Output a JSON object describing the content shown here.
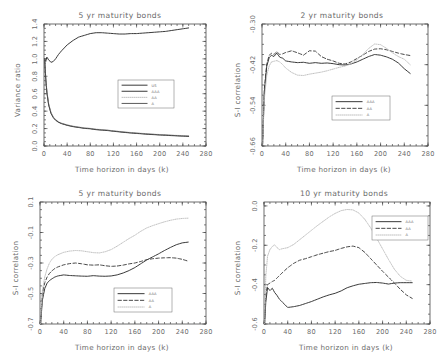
{
  "figure": {
    "panels": [
      {
        "id": "panel-5yr-variance-ratio",
        "title": "5 yr maturity bonds",
        "xlabel": "Time horizon in days (k)",
        "ylabel": "Variance ratio",
        "legend": [
          "US",
          "AAA",
          "AA",
          "A"
        ]
      },
      {
        "id": "panel-2yr-correlation",
        "title": "2 yr maturity bonds",
        "xlabel": "Time horizon in days (k)",
        "ylabel": "S-I correlation",
        "legend": [
          "AAA",
          "AA",
          "A"
        ]
      },
      {
        "id": "panel-5yr-correlation",
        "title": "5 yr maturity bonds",
        "xlabel": "Time horizon in days (k)",
        "ylabel": "S-I correlation",
        "legend": [
          "AAA",
          "AA",
          "A"
        ]
      },
      {
        "id": "panel-10yr-correlation",
        "title": "10 yr maturity bonds",
        "xlabel": "Time horizon in days (k)",
        "ylabel": "S-I correlation",
        "legend": [
          "AAA",
          "AA",
          "A"
        ]
      }
    ]
  },
  "chart_data": [
    {
      "type": "line",
      "title": "5 yr maturity bonds",
      "xlabel": "Time horizon in days (k)",
      "ylabel": "Variance ratio",
      "xlim": [
        0,
        280
      ],
      "ylim": [
        0.0,
        1.4
      ],
      "xticks": [
        0,
        40,
        80,
        120,
        160,
        200,
        240,
        280
      ],
      "yticks": [
        0.0,
        0.2,
        0.4,
        0.6,
        0.8,
        1.0,
        1.2,
        1.4
      ],
      "grid": false,
      "legend_position": "center-right",
      "x": [
        1,
        3,
        5,
        8,
        12,
        16,
        20,
        25,
        30,
        40,
        50,
        60,
        70,
        80,
        90,
        100,
        110,
        120,
        130,
        140,
        150,
        160,
        170,
        180,
        190,
        200,
        210,
        220,
        230,
        240,
        250
      ],
      "series": [
        {
          "name": "US",
          "style": "solid",
          "values": [
            1.0,
            0.97,
            1.02,
            0.99,
            0.96,
            0.97,
            1.0,
            1.05,
            1.09,
            1.16,
            1.21,
            1.25,
            1.27,
            1.29,
            1.3,
            1.3,
            1.295,
            1.29,
            1.285,
            1.285,
            1.29,
            1.29,
            1.295,
            1.3,
            1.305,
            1.31,
            1.315,
            1.325,
            1.335,
            1.345,
            1.355
          ]
        },
        {
          "name": "AAA",
          "style": "solid",
          "values": [
            1.0,
            0.78,
            0.62,
            0.48,
            0.38,
            0.33,
            0.3,
            0.275,
            0.26,
            0.24,
            0.225,
            0.215,
            0.205,
            0.2,
            0.19,
            0.185,
            0.18,
            0.172,
            0.165,
            0.158,
            0.152,
            0.147,
            0.142,
            0.137,
            0.133,
            0.129,
            0.126,
            0.122,
            0.119,
            0.116,
            0.113
          ]
        },
        {
          "name": "AA",
          "style": "dotted",
          "values": [
            1.0,
            0.79,
            0.63,
            0.49,
            0.39,
            0.335,
            0.305,
            0.28,
            0.263,
            0.243,
            0.229,
            0.218,
            0.209,
            0.203,
            0.194,
            0.188,
            0.183,
            0.175,
            0.168,
            0.161,
            0.155,
            0.15,
            0.145,
            0.14,
            0.136,
            0.132,
            0.129,
            0.125,
            0.122,
            0.119,
            0.116
          ]
        },
        {
          "name": "A",
          "style": "dashdot",
          "values": [
            1.0,
            0.77,
            0.61,
            0.47,
            0.375,
            0.325,
            0.295,
            0.272,
            0.257,
            0.237,
            0.222,
            0.212,
            0.202,
            0.197,
            0.187,
            0.182,
            0.177,
            0.169,
            0.162,
            0.155,
            0.149,
            0.144,
            0.139,
            0.134,
            0.13,
            0.126,
            0.123,
            0.119,
            0.116,
            0.113,
            0.11
          ]
        }
      ]
    },
    {
      "type": "line",
      "title": "2 yr maturity bonds",
      "xlabel": "Time horizon in days (k)",
      "ylabel": "S-I correlation",
      "xlim": [
        0,
        280
      ],
      "ylim": [
        -0.66,
        -0.3
      ],
      "xticks": [
        0,
        40,
        80,
        120,
        160,
        200,
        240,
        280
      ],
      "yticks": [
        -0.66,
        -0.54,
        -0.42,
        -0.3
      ],
      "grid": false,
      "legend_position": "lower-right",
      "x": [
        1,
        4,
        8,
        12,
        16,
        20,
        25,
        30,
        35,
        40,
        50,
        60,
        70,
        80,
        90,
        100,
        110,
        120,
        130,
        140,
        150,
        160,
        170,
        180,
        190,
        200,
        210,
        220,
        230,
        240,
        250
      ],
      "series": [
        {
          "name": "AAA",
          "style": "solid",
          "values": [
            -0.655,
            -0.5,
            -0.425,
            -0.4,
            -0.392,
            -0.396,
            -0.386,
            -0.398,
            -0.401,
            -0.409,
            -0.412,
            -0.414,
            -0.413,
            -0.416,
            -0.414,
            -0.416,
            -0.415,
            -0.417,
            -0.42,
            -0.421,
            -0.418,
            -0.412,
            -0.404,
            -0.396,
            -0.39,
            -0.392,
            -0.397,
            -0.404,
            -0.415,
            -0.432,
            -0.446
          ]
        },
        {
          "name": "AA",
          "style": "dashed",
          "values": [
            -0.655,
            -0.49,
            -0.418,
            -0.393,
            -0.386,
            -0.39,
            -0.382,
            -0.39,
            -0.388,
            -0.384,
            -0.379,
            -0.385,
            -0.392,
            -0.379,
            -0.38,
            -0.396,
            -0.404,
            -0.409,
            -0.416,
            -0.418,
            -0.412,
            -0.402,
            -0.392,
            -0.381,
            -0.374,
            -0.373,
            -0.376,
            -0.381,
            -0.386,
            -0.39,
            -0.393
          ]
        },
        {
          "name": "A",
          "style": "dotted",
          "values": [
            -0.655,
            -0.52,
            -0.452,
            -0.424,
            -0.412,
            -0.41,
            -0.408,
            -0.412,
            -0.42,
            -0.43,
            -0.443,
            -0.451,
            -0.452,
            -0.448,
            -0.445,
            -0.442,
            -0.438,
            -0.433,
            -0.428,
            -0.424,
            -0.418,
            -0.406,
            -0.39,
            -0.372,
            -0.359,
            -0.361,
            -0.372,
            -0.385,
            -0.396,
            -0.404,
            -0.42
          ]
        }
      ]
    },
    {
      "type": "line",
      "title": "5 yr maturity bonds",
      "xlabel": "Time horizon in days (k)",
      "ylabel": "S-I correlation",
      "xlim": [
        0,
        280
      ],
      "ylim": [
        -0.7,
        0.1
      ],
      "xticks": [
        0,
        40,
        80,
        120,
        160,
        200,
        240,
        280
      ],
      "yticks": [
        -0.7,
        -0.5,
        -0.3,
        -0.1,
        0.1
      ],
      "grid": false,
      "legend_position": "lower-right",
      "x": [
        1,
        4,
        8,
        12,
        16,
        20,
        25,
        30,
        40,
        50,
        60,
        70,
        80,
        90,
        100,
        110,
        120,
        130,
        140,
        150,
        160,
        170,
        180,
        190,
        200,
        210,
        220,
        230,
        240,
        250
      ],
      "series": [
        {
          "name": "AAA",
          "style": "solid",
          "values": [
            -0.7,
            -0.545,
            -0.468,
            -0.432,
            -0.415,
            -0.404,
            -0.392,
            -0.385,
            -0.378,
            -0.382,
            -0.384,
            -0.386,
            -0.387,
            -0.383,
            -0.386,
            -0.387,
            -0.385,
            -0.378,
            -0.366,
            -0.35,
            -0.33,
            -0.305,
            -0.28,
            -0.26,
            -0.24,
            -0.218,
            -0.198,
            -0.18,
            -0.168,
            -0.163
          ]
        },
        {
          "name": "AA",
          "style": "dashed",
          "values": [
            -0.7,
            -0.5,
            -0.43,
            -0.392,
            -0.368,
            -0.352,
            -0.336,
            -0.326,
            -0.312,
            -0.304,
            -0.3,
            -0.305,
            -0.312,
            -0.314,
            -0.312,
            -0.318,
            -0.322,
            -0.32,
            -0.314,
            -0.306,
            -0.3,
            -0.29,
            -0.278,
            -0.272,
            -0.268,
            -0.266,
            -0.265,
            -0.268,
            -0.276,
            -0.288
          ]
        },
        {
          "name": "A",
          "style": "dotted",
          "values": [
            -0.7,
            -0.48,
            -0.392,
            -0.338,
            -0.3,
            -0.276,
            -0.258,
            -0.246,
            -0.23,
            -0.222,
            -0.218,
            -0.22,
            -0.226,
            -0.232,
            -0.234,
            -0.226,
            -0.212,
            -0.19,
            -0.165,
            -0.14,
            -0.118,
            -0.092,
            -0.07,
            -0.055,
            -0.042,
            -0.03,
            -0.02,
            -0.012,
            -0.008,
            -0.006
          ]
        }
      ]
    },
    {
      "type": "line",
      "title": "10 yr maturity bonds",
      "xlabel": "Time horizon in days (k)",
      "ylabel": "S-I correlation",
      "xlim": [
        0,
        280
      ],
      "ylim": [
        -0.6,
        0.02
      ],
      "xticks": [
        0,
        40,
        80,
        120,
        160,
        200,
        240,
        280
      ],
      "yticks": [
        -0.6,
        -0.4,
        -0.2,
        -0.0
      ],
      "grid": false,
      "legend_position": "upper-right",
      "x": [
        1,
        3,
        6,
        10,
        14,
        18,
        22,
        26,
        30,
        40,
        50,
        60,
        70,
        80,
        90,
        100,
        110,
        120,
        130,
        140,
        150,
        160,
        170,
        180,
        190,
        200,
        210,
        220,
        230,
        240,
        250
      ],
      "series": [
        {
          "name": "AAA",
          "style": "solid",
          "values": [
            -0.6,
            -0.49,
            -0.415,
            -0.43,
            -0.418,
            -0.44,
            -0.455,
            -0.474,
            -0.486,
            -0.516,
            -0.512,
            -0.506,
            -0.496,
            -0.486,
            -0.474,
            -0.462,
            -0.452,
            -0.444,
            -0.432,
            -0.416,
            -0.406,
            -0.398,
            -0.394,
            -0.39,
            -0.389,
            -0.392,
            -0.397,
            -0.392,
            -0.39,
            -0.39,
            -0.39
          ]
        },
        {
          "name": "AA",
          "style": "dashed",
          "values": [
            -0.6,
            -0.455,
            -0.4,
            -0.392,
            -0.384,
            -0.378,
            -0.366,
            -0.354,
            -0.342,
            -0.314,
            -0.292,
            -0.276,
            -0.268,
            -0.258,
            -0.248,
            -0.24,
            -0.232,
            -0.226,
            -0.216,
            -0.208,
            -0.204,
            -0.212,
            -0.236,
            -0.268,
            -0.3,
            -0.332,
            -0.362,
            -0.392,
            -0.424,
            -0.452,
            -0.47
          ]
        },
        {
          "name": "A",
          "style": "dotted",
          "values": [
            -0.6,
            -0.36,
            -0.255,
            -0.222,
            -0.206,
            -0.198,
            -0.212,
            -0.222,
            -0.218,
            -0.212,
            -0.196,
            -0.172,
            -0.148,
            -0.124,
            -0.1,
            -0.078,
            -0.056,
            -0.038,
            -0.024,
            -0.018,
            -0.02,
            -0.036,
            -0.068,
            -0.112,
            -0.164,
            -0.218,
            -0.272,
            -0.322,
            -0.358,
            -0.378,
            -0.382
          ]
        }
      ]
    }
  ]
}
